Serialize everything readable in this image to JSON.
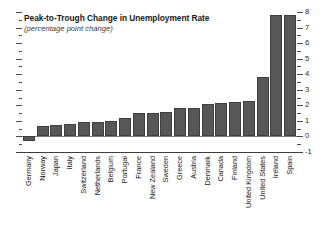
{
  "chart_data": {
    "type": "bar",
    "title": "Peak-to-Trough Change in Unemployment Rate",
    "subtitle": "(percentage point change)",
    "xlabel": "",
    "ylabel": "",
    "ylim": [
      -1,
      8
    ],
    "ytick_labels": [
      "-1",
      "0",
      "1",
      "2",
      "3",
      "4",
      "5",
      "6",
      "7",
      "8"
    ],
    "ytick_values": [
      -1,
      0,
      1,
      2,
      3,
      4,
      5,
      6,
      7,
      8
    ],
    "minor_ticks": true,
    "grid": false,
    "legend": "none",
    "bar_color": "#575757",
    "axis_label_side": "right",
    "categories": [
      "Germany",
      "Norway",
      "Japan",
      "Italy",
      "Switzerland",
      "Netherlands",
      "Belgium",
      "Portugal",
      "France",
      "New Zealand",
      "Sweden",
      "Greece",
      "Austria",
      "Denmark",
      "Canada",
      "Finland",
      "United Kingdom",
      "United States",
      "Ireland",
      "Spain"
    ],
    "values": [
      -0.3,
      0.7,
      0.75,
      0.8,
      0.9,
      0.95,
      1.0,
      1.2,
      1.5,
      1.5,
      1.6,
      1.8,
      1.85,
      2.1,
      2.15,
      2.2,
      2.3,
      3.8,
      7.8,
      7.8
    ]
  }
}
